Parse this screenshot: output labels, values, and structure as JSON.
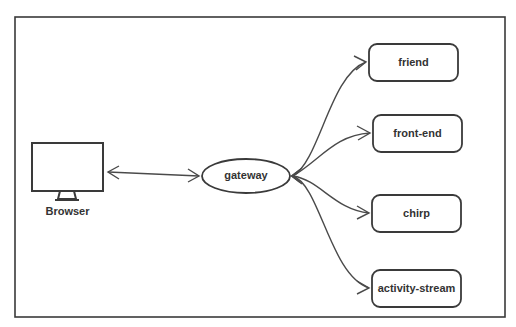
{
  "diagram": {
    "nodes": {
      "browser": {
        "label": "Browser",
        "shape": "monitor-icon"
      },
      "gateway": {
        "label": "gateway",
        "shape": "ellipse"
      },
      "friend": {
        "label": "friend",
        "shape": "rounded-rect"
      },
      "front_end": {
        "label": "front-end",
        "shape": "rounded-rect"
      },
      "chirp": {
        "label": "chirp",
        "shape": "rounded-rect"
      },
      "activity_stream": {
        "label": "activity-stream",
        "shape": "rounded-rect"
      }
    },
    "edges": [
      {
        "from": "browser",
        "to": "gateway",
        "bidirectional": true
      },
      {
        "from": "gateway",
        "to": "friend"
      },
      {
        "from": "gateway",
        "to": "front_end"
      },
      {
        "from": "gateway",
        "to": "chirp"
      },
      {
        "from": "gateway",
        "to": "activity_stream"
      }
    ],
    "colors": {
      "stroke": "#3a3a3a",
      "text": "#333333",
      "background": "#ffffff"
    }
  }
}
